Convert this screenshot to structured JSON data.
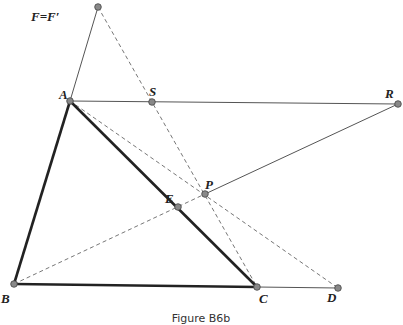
{
  "figure": {
    "caption": "Figure B6b",
    "points": [
      {
        "id": "F",
        "label": "F=F′"
      },
      {
        "id": "A",
        "label": "A"
      },
      {
        "id": "S",
        "label": "S"
      },
      {
        "id": "R",
        "label": "R"
      },
      {
        "id": "P",
        "label": "P"
      },
      {
        "id": "E",
        "label": "E"
      },
      {
        "id": "B",
        "label": "B"
      },
      {
        "id": "C",
        "label": "C"
      },
      {
        "id": "D",
        "label": "D"
      }
    ],
    "segments": {
      "thick": [
        [
          "A",
          "B"
        ],
        [
          "B",
          "C"
        ],
        [
          "A",
          "C"
        ]
      ],
      "solid": [
        [
          "F",
          "A"
        ],
        [
          "A",
          "R"
        ],
        [
          "P",
          "R"
        ],
        [
          "C",
          "D"
        ]
      ],
      "dashed": [
        [
          "A",
          "D"
        ],
        [
          "F",
          "C"
        ],
        [
          "B",
          "P"
        ]
      ]
    },
    "colors": {
      "line": "#222222",
      "thin": "#555555",
      "dash": "#666666",
      "point": "#888888"
    }
  }
}
